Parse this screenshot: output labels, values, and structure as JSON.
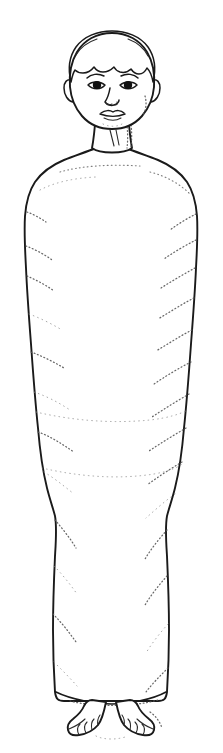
{
  "canvas": {
    "width": 223,
    "height": 753,
    "background_color": "#ffffff",
    "ink_color": "#1a1a1a",
    "shading_color": "#6d6d6d",
    "medium": "black-and-white line drawing with stipple shading"
  },
  "artwork": {
    "title": "Swaddled standing figure",
    "description": "Line drawing of a standing child wrapped in cloth bindings from the shoulders to the ankles, with the head and bare feet left exposed.",
    "subject": "swaddled-child",
    "view": "frontal full-body",
    "alt_text": "Front view line illustration of a child tightly wrapped in swaddling cloth from shoulders to ankles; the head, neck and two bare feet with toes remain uncovered."
  },
  "parts": {
    "head": {
      "label": "Head",
      "features": [
        "hair",
        "forehead",
        "eyebrows",
        "eyes",
        "nose",
        "mouth",
        "ears",
        "chin"
      ]
    },
    "hair": {
      "label": "Hair",
      "style": "short cap of hair with wavy fringe across the forehead"
    },
    "eyes": {
      "label": "Eyes",
      "count": 2,
      "pupil_color": "#111111",
      "note": "almond shaped with solid dark irises"
    },
    "eyebrows": {
      "label": "Eyebrows",
      "count": 2
    },
    "nose": {
      "label": "Nose",
      "note": "small nose with two nostril marks"
    },
    "mouth": {
      "label": "Mouth",
      "note": "closed lips drawn as a dark horizontal line"
    },
    "ears": {
      "label": "Ears",
      "count": 2
    },
    "neck": {
      "label": "Neck",
      "note": "two short tendon lines at the front, hatching on the right side"
    },
    "wrapping": {
      "label": "Swaddling wrap",
      "coverage": "shoulders to ankles",
      "note": "smooth outer contour with stippled bands suggesting overlapping cloth windings",
      "band_count": 12
    },
    "shoulders": {
      "label": "Shoulders",
      "note": "rounded, sloping out from the neck"
    },
    "feet": {
      "label": "Bare feet",
      "count": 2,
      "toes_per_foot": 5,
      "note": "both feet emerge below the hem of the wrap, toes drawn individually"
    },
    "hem": {
      "label": "Hem of the wrap",
      "note": "rounded lower edge of the cloth just above the ankles"
    }
  },
  "measurements": {
    "head_top_y": 32,
    "chin_y": 128,
    "shoulder_y": 160,
    "widest_body_y": 250,
    "hem_y": 697,
    "feet_bottom_y": 742,
    "body_left_x": 25,
    "body_right_x": 200
  }
}
